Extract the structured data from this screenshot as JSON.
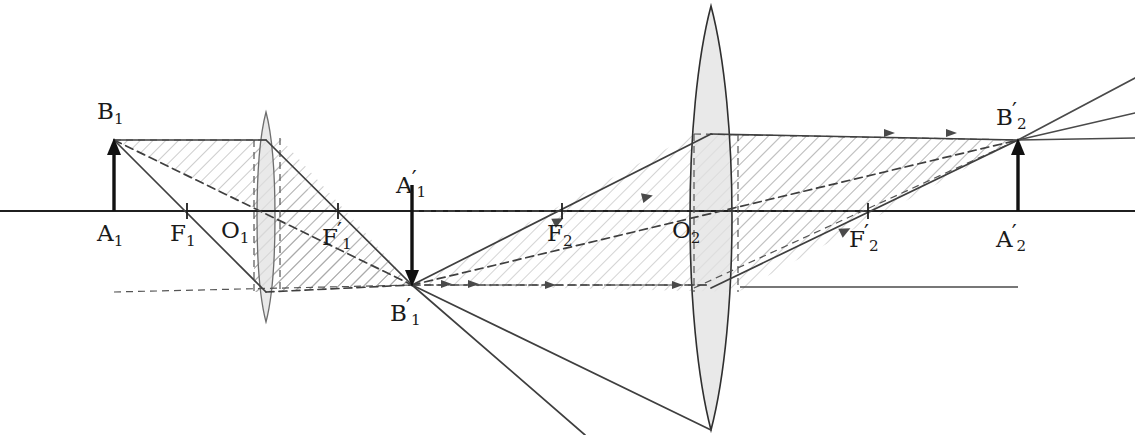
{
  "figure": {
    "kind": "optics-ray-diagram",
    "width": 1135,
    "height": 435,
    "background": "#ffffff",
    "axis_y": 211,
    "colors": {
      "ink": "#2b2b2b",
      "solid_ray": "#4a4a4a",
      "dashed_ray": "#555555",
      "lens_fill": "#e2e2e2",
      "lens_stroke": "#3a3a3a",
      "hatch": "#9a9a9a",
      "beam_fill": "#ededed"
    }
  },
  "labels": [
    {
      "name": "label-B1",
      "base": "B",
      "sub": "1",
      "prime": false,
      "x": 97,
      "y": 100
    },
    {
      "name": "label-A1",
      "base": "A",
      "sub": "1",
      "prime": false,
      "x": 97,
      "y": 222
    },
    {
      "name": "label-F1",
      "base": "F",
      "sub": "1",
      "prime": false,
      "x": 170,
      "y": 222
    },
    {
      "name": "label-O1",
      "base": "O",
      "sub": "1",
      "prime": false,
      "x": 221,
      "y": 219
    },
    {
      "name": "label-F1-prime",
      "base": "F",
      "sub": "1",
      "prime": true,
      "x": 322,
      "y": 220
    },
    {
      "name": "label-A1-prime",
      "base": "A",
      "sub": "1",
      "prime": true,
      "x": 396,
      "y": 168
    },
    {
      "name": "label-B1-prime",
      "base": "B",
      "sub": "1",
      "prime": true,
      "x": 390,
      "y": 296
    },
    {
      "name": "label-F2",
      "base": "F",
      "sub": "2",
      "prime": false,
      "x": 547,
      "y": 222
    },
    {
      "name": "label-O2",
      "base": "O",
      "sub": "2",
      "prime": false,
      "x": 672,
      "y": 219
    },
    {
      "name": "label-F2-prime",
      "base": "F",
      "sub": "2",
      "prime": true,
      "x": 849,
      "y": 222
    },
    {
      "name": "label-B2-prime",
      "base": "B",
      "sub": "2",
      "prime": true,
      "x": 996,
      "y": 100
    },
    {
      "name": "label-A2-prime",
      "base": "A",
      "sub": "2",
      "prime": true,
      "x": 996,
      "y": 222
    }
  ],
  "points": {
    "A1": {
      "x": 114,
      "y": 211
    },
    "B1": {
      "x": 114,
      "y": 140
    },
    "F1": {
      "x": 187,
      "y": 211
    },
    "O1": {
      "x": 266,
      "y": 211
    },
    "F1_prime": {
      "x": 338,
      "y": 211
    },
    "A1_prime": {
      "x": 412,
      "y": 211
    },
    "B1_prime": {
      "x": 412,
      "y": 285
    },
    "F2": {
      "x": 562,
      "y": 211
    },
    "O2": {
      "x": 711,
      "y": 211
    },
    "F2_prime": {
      "x": 868,
      "y": 211
    },
    "A2_prime": {
      "x": 1018,
      "y": 211
    },
    "B2_prime": {
      "x": 1018,
      "y": 140
    }
  },
  "optical_axis": {
    "name": "optical-axis",
    "x1": 0,
    "x2": 1135,
    "y": 211
  },
  "lenses": [
    {
      "name": "lens-1",
      "cx": 266,
      "top": 112,
      "bottom": 322,
      "half_width": 12,
      "type": "biconvex"
    },
    {
      "name": "lens-2",
      "cx": 711,
      "top": 6,
      "bottom": 430,
      "half_width": 28,
      "type": "biconvex"
    }
  ],
  "objects": [
    {
      "name": "object-arrow-1",
      "from": "A1",
      "to": "B1",
      "direction": "up"
    },
    {
      "name": "image-arrow-1",
      "from": "A1_prime",
      "to": "B1_prime",
      "direction": "down"
    },
    {
      "name": "image-arrow-2",
      "from": "A2_prime",
      "to": "B2_prime",
      "direction": "up"
    }
  ],
  "tick_marks": [
    "F1",
    "F1_prime",
    "F2",
    "F2_prime"
  ],
  "beams": [
    {
      "name": "beam-object-to-image1",
      "hatched": true
    },
    {
      "name": "beam-image1-to-lens2",
      "hatched": true
    },
    {
      "name": "beam-lens2-to-image2",
      "hatched": true
    }
  ],
  "rays": {
    "set_1_label": "rays from B1 through lens 1 converging at B1-prime",
    "set_2_label": "rays from B1-prime through lens 2 converging at B2-prime",
    "set_3_label": "rays diverging beyond B2-prime"
  }
}
